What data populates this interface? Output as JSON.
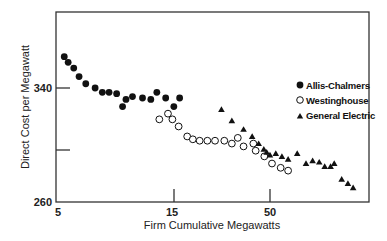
{
  "chart_data": {
    "type": "scatter",
    "title": "",
    "xlabel": "Firm Cumulative Megawatts",
    "ylabel": "Direct Cost per Megawatt",
    "x_scale": "log-like",
    "x_ticks": [
      {
        "value": 5,
        "label": "5"
      },
      {
        "value": 15,
        "label": "15"
      },
      {
        "value": 50,
        "label": "50"
      }
    ],
    "y_ticks": [
      {
        "value": 260,
        "label": "260"
      },
      {
        "value": 300,
        "label": ""
      },
      {
        "value": 340,
        "label": "340"
      }
    ],
    "xlim": [
      5,
      150
    ],
    "ylim": [
      260,
      380
    ],
    "grid": false,
    "legend_position": "right-middle inside",
    "series": [
      {
        "name": "Allis-Chalmers",
        "marker": "filled-circle",
        "points": [
          [
            5.4,
            362
          ],
          [
            5.6,
            358
          ],
          [
            5.9,
            354
          ],
          [
            6.2,
            348
          ],
          [
            6.6,
            343
          ],
          [
            7.2,
            340
          ],
          [
            7.7,
            337
          ],
          [
            8.2,
            337
          ],
          [
            8.8,
            336
          ],
          [
            9.3,
            327
          ],
          [
            9.6,
            332
          ],
          [
            10.2,
            334
          ],
          [
            11.2,
            333
          ],
          [
            12.1,
            332
          ],
          [
            12.8,
            337
          ],
          [
            13.9,
            333
          ],
          [
            15.0,
            327
          ],
          [
            16.1,
            333
          ]
        ]
      },
      {
        "name": "Westinghouse",
        "marker": "open-circle",
        "points": [
          [
            13.1,
            318
          ],
          [
            14.2,
            322
          ],
          [
            14.8,
            318
          ],
          [
            15.9,
            313
          ],
          [
            17.7,
            306
          ],
          [
            19.0,
            304
          ],
          [
            20.7,
            303
          ],
          [
            22.8,
            303
          ],
          [
            25.1,
            303
          ],
          [
            28.2,
            303
          ],
          [
            31.0,
            301
          ],
          [
            33.4,
            305
          ],
          [
            35.9,
            299
          ],
          [
            40.6,
            301
          ],
          [
            41.8,
            296
          ],
          [
            46.6,
            292
          ],
          [
            51.3,
            287
          ],
          [
            57.2,
            284
          ],
          [
            62.8,
            282
          ]
        ]
      },
      {
        "name": "General Electric",
        "marker": "filled-triangle",
        "points": [
          [
            27.2,
            325
          ],
          [
            31.0,
            317
          ],
          [
            35.9,
            311
          ],
          [
            40.0,
            306
          ],
          [
            43.4,
            301
          ],
          [
            46.3,
            297
          ],
          [
            48.0,
            295
          ],
          [
            50.0,
            293
          ],
          [
            53.8,
            294
          ],
          [
            58.1,
            292
          ],
          [
            62.8,
            290
          ],
          [
            70.4,
            294
          ],
          [
            78.6,
            287
          ],
          [
            85.4,
            289
          ],
          [
            92.8,
            288
          ],
          [
            99.4,
            285
          ],
          [
            107,
            285
          ],
          [
            112,
            287
          ],
          [
            123,
            276
          ],
          [
            133,
            273
          ],
          [
            142,
            270
          ]
        ]
      }
    ]
  },
  "legend": [
    {
      "label": "Allis-Chalmers",
      "marker": "filled-circle"
    },
    {
      "label": "Westinghouse",
      "marker": "open-circle"
    },
    {
      "label": "General Electric",
      "marker": "filled-triangle"
    }
  ],
  "axes": {
    "x_title": "Firm Cumulative Megawatts",
    "y_title": "Direct Cost per Megawatt",
    "x_tick_labels": [
      "5",
      "15",
      "50"
    ],
    "y_tick_labels": [
      "340",
      "260"
    ]
  }
}
